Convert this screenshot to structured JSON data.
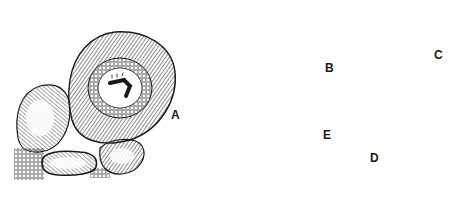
{
  "figure": {
    "background_color": "#ffffff",
    "ink_color": "#1a1a1a"
  },
  "labels": {
    "A": "A",
    "B": "B",
    "C": "C",
    "D": "D",
    "E": "E"
  },
  "panels": [
    {
      "id": "A",
      "depicts": "stone case built on rocks with larva inside, and case attached to rock face"
    },
    {
      "id": "B",
      "depicts": "larva emerging from tubular case; case and separated larva with arrow"
    },
    {
      "id": "C",
      "depicts": "cased-caddis imitation tied on hook"
    },
    {
      "id": "D",
      "depicts": "adult caddisfly and winged wet-fly imitation"
    },
    {
      "id": "E",
      "depicts": "adult caddisfly with tent wings"
    },
    {
      "id": "hook",
      "depicts": "larva imitation on hook with leader line and arrow"
    }
  ]
}
